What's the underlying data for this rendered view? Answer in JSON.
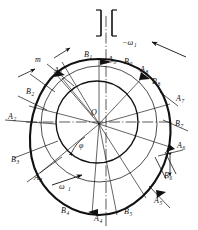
{
  "figure": {
    "type": "cam-profile-construction-diagram",
    "center_label": "O",
    "module_label": "m",
    "omega_driven_label": "−ω",
    "omega_driven_sub": "1",
    "omega_drive_label": "ω",
    "omega_drive_sub": "1",
    "inner_angle_label": "φ",
    "top_support_icon": "fixed-ground-hatch-icon"
  },
  "colors": {
    "ink": "#111111",
    "paper": "#ffffff",
    "thin": "#222222"
  },
  "points_a": [
    {
      "id": "A0",
      "letter": "A",
      "sub": "0",
      "x": 108,
      "y": 62
    },
    {
      "id": "A1",
      "letter": "A",
      "sub": "1",
      "x": 54,
      "y": 73
    },
    {
      "id": "A2",
      "letter": "A",
      "sub": "2",
      "x": 8,
      "y": 119
    },
    {
      "id": "A3",
      "letter": "A",
      "sub": "3",
      "x": 34,
      "y": 180
    },
    {
      "id": "A4",
      "letter": "A",
      "sub": "4",
      "x": 94,
      "y": 221
    },
    {
      "id": "A5",
      "letter": "A",
      "sub": "5",
      "x": 154,
      "y": 203
    },
    {
      "id": "A6",
      "letter": "A",
      "sub": "6",
      "x": 177,
      "y": 148
    },
    {
      "id": "A7",
      "letter": "A",
      "sub": "7",
      "x": 176,
      "y": 101
    },
    {
      "id": "A8",
      "letter": "A",
      "sub": "8",
      "x": 140,
      "y": 72
    }
  ],
  "points_b": [
    {
      "id": "B0",
      "letter": "B",
      "sub": "0",
      "x": 124,
      "y": 64
    },
    {
      "id": "B1",
      "letter": "B",
      "sub": "1",
      "x": 84,
      "y": 57
    },
    {
      "id": "B2",
      "letter": "B",
      "sub": "2",
      "x": 26,
      "y": 94
    },
    {
      "id": "B3",
      "letter": "B",
      "sub": "3",
      "x": 11,
      "y": 162
    },
    {
      "id": "B4",
      "letter": "B",
      "sub": "4",
      "x": 61,
      "y": 213
    },
    {
      "id": "B5",
      "letter": "B",
      "sub": "5",
      "x": 124,
      "y": 214
    },
    {
      "id": "B6",
      "letter": "B",
      "sub": "6",
      "x": 164,
      "y": 178
    },
    {
      "id": "B7",
      "letter": "B",
      "sub": "7",
      "x": 175,
      "y": 126
    },
    {
      "id": "B8",
      "letter": "B",
      "sub": "8",
      "x": 152,
      "y": 84
    }
  ],
  "geometry": {
    "center": {
      "x": 97,
      "y": 122
    },
    "base_circle_r": 41,
    "cam_outer_rx": 62,
    "cam_outer_ry": 64,
    "pitch_circle_r": 55,
    "spoke_count": 9
  }
}
